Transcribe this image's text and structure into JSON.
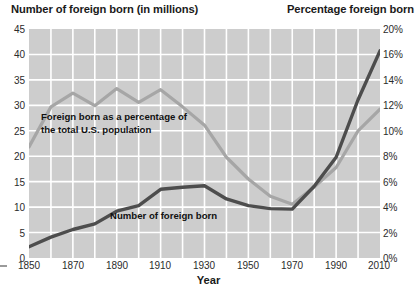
{
  "titles": {
    "left_axis": "Number of foreign born (in millions)",
    "right_axis": "Percentage foreign born",
    "x_axis": "Year"
  },
  "annotations": {
    "percentage_line_1": "Foreign born as a percentage of",
    "percentage_line_2": "the total U.S. population",
    "number_line": "Number of foreign born"
  },
  "ticks": {
    "left": [
      "45",
      "40",
      "35",
      "30",
      "25",
      "20",
      "15",
      "10",
      "5",
      "0"
    ],
    "right": [
      "20%",
      "16%",
      "14%",
      "12%",
      "10%",
      "8%",
      "6%",
      "4%",
      "2%",
      "0%"
    ],
    "x": [
      "1850",
      "1870",
      "1890",
      "1910",
      "1930",
      "1950",
      "1970",
      "1990",
      "2010"
    ]
  },
  "colors": {
    "plot_background": "#cdcdcd",
    "gridline": "#ffffff",
    "number_line": "#4d4d4d",
    "percentage_line": "#a6a6a6",
    "text": "#1a1a1a"
  },
  "chart_data": {
    "type": "line",
    "title": "",
    "xlabel": "Year",
    "ylabel": "Number of foreign born (in millions)",
    "y2label": "Percentage foreign born",
    "xlim": [
      1850,
      2010
    ],
    "ylim": [
      0,
      45
    ],
    "y2lim": [
      0,
      20
    ],
    "grid": true,
    "legend": "annotations-inline",
    "x": [
      1850,
      1860,
      1870,
      1880,
      1890,
      1900,
      1910,
      1920,
      1930,
      1940,
      1950,
      1960,
      1970,
      1980,
      1990,
      2000,
      2010
    ],
    "series": [
      {
        "name": "Number of foreign born",
        "axis": "left",
        "units": "millions",
        "color": "#4d4d4d",
        "values": [
          2.2,
          4.1,
          5.6,
          6.7,
          9.2,
          10.3,
          13.5,
          13.9,
          14.2,
          11.6,
          10.3,
          9.7,
          9.6,
          14.1,
          19.8,
          31.1,
          40.7
        ]
      },
      {
        "name": "Foreign born as a percentage of the total U.S. population",
        "axis": "right",
        "units": "percent",
        "color": "#a6a6a6",
        "values": [
          9.7,
          13.2,
          14.4,
          13.3,
          14.8,
          13.6,
          14.7,
          13.2,
          11.6,
          8.8,
          6.9,
          5.4,
          4.7,
          6.2,
          7.9,
          11.1,
          13.0
        ]
      }
    ]
  }
}
